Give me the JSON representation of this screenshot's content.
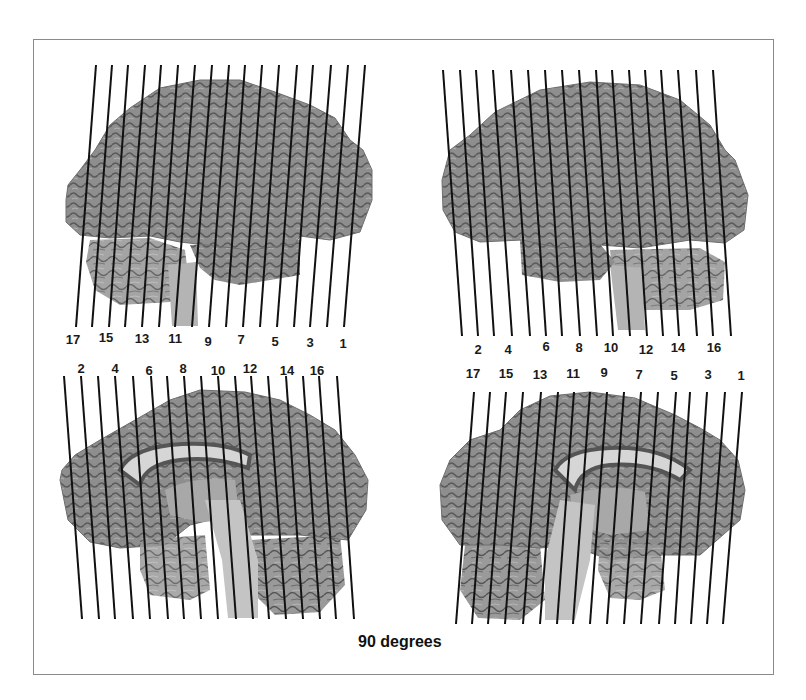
{
  "caption": "90 degrees",
  "colors": {
    "frame": "#8a8a8a",
    "line": "#111111",
    "brain_fill": "#8c8c8c",
    "brain_dark": "#4a4a4a",
    "brain_light": "#c8c8c8",
    "callosum": "#d9d9d9"
  },
  "panels": [
    {
      "id": "top-left",
      "view": "lateral-left",
      "line_top_y": 65,
      "line_bottom_y": 327,
      "lines_top_x": [
        96,
        112,
        128,
        145,
        161,
        178,
        195,
        212,
        229,
        245,
        262,
        279,
        297,
        313,
        331,
        348,
        365
      ],
      "lines_bottom_x": [
        76,
        92,
        109,
        125,
        142,
        159,
        175,
        192,
        209,
        226,
        243,
        260,
        277,
        294,
        310,
        327,
        344
      ],
      "labels": [
        {
          "text": "17",
          "x": 73,
          "y": 332
        },
        {
          "text": "15",
          "x": 106,
          "y": 330
        },
        {
          "text": "13",
          "x": 142,
          "y": 331
        },
        {
          "text": "11",
          "x": 175,
          "y": 331
        },
        {
          "text": "9",
          "x": 208,
          "y": 334
        },
        {
          "text": "7",
          "x": 241,
          "y": 332
        },
        {
          "text": "5",
          "x": 275,
          "y": 334
        },
        {
          "text": "3",
          "x": 310,
          "y": 335
        },
        {
          "text": "1",
          "x": 343,
          "y": 336
        }
      ]
    },
    {
      "id": "top-right",
      "view": "lateral-right",
      "line_top_y": 70,
      "line_bottom_y": 336,
      "lines_top_x": [
        443,
        460,
        476,
        493,
        511,
        528,
        545,
        562,
        579,
        596,
        612,
        629,
        645,
        661,
        678,
        696,
        713
      ],
      "lines_bottom_x": [
        462,
        478,
        494,
        512,
        530,
        546,
        562,
        580,
        597,
        613,
        630,
        647,
        663,
        679,
        697,
        713,
        731
      ],
      "labels": [
        {
          "text": "2",
          "x": 478,
          "y": 342
        },
        {
          "text": "4",
          "x": 508,
          "y": 342
        },
        {
          "text": "6",
          "x": 546,
          "y": 339
        },
        {
          "text": "8",
          "x": 579,
          "y": 340
        },
        {
          "text": "10",
          "x": 611,
          "y": 340
        },
        {
          "text": "12",
          "x": 646,
          "y": 342
        },
        {
          "text": "14",
          "x": 678,
          "y": 340
        },
        {
          "text": "16",
          "x": 714,
          "y": 340
        }
      ]
    },
    {
      "id": "bottom-left",
      "view": "medial-left",
      "line_top_y": 376,
      "line_bottom_y": 619,
      "lines_top_x": [
        64,
        81,
        98,
        115,
        133,
        151,
        167,
        184,
        201,
        218,
        235,
        251,
        268,
        286,
        303,
        319,
        337
      ],
      "lines_bottom_x": [
        82,
        99,
        115,
        133,
        150,
        168,
        184,
        201,
        218,
        236,
        253,
        269,
        286,
        303,
        320,
        336,
        354
      ],
      "labels": [
        {
          "text": "2",
          "x": 81,
          "y": 361
        },
        {
          "text": "4",
          "x": 115,
          "y": 361
        },
        {
          "text": "6",
          "x": 149,
          "y": 363
        },
        {
          "text": "8",
          "x": 183,
          "y": 361
        },
        {
          "text": "10",
          "x": 218,
          "y": 363
        },
        {
          "text": "12",
          "x": 250,
          "y": 361
        },
        {
          "text": "14",
          "x": 287,
          "y": 363
        },
        {
          "text": "16",
          "x": 317,
          "y": 363
        }
      ]
    },
    {
      "id": "bottom-right",
      "view": "medial-right",
      "line_top_y": 392,
      "line_bottom_y": 624,
      "lines_top_x": [
        474,
        490,
        506,
        523,
        541,
        558,
        574,
        590,
        607,
        624,
        641,
        658,
        676,
        690,
        707,
        725,
        742
      ],
      "lines_bottom_x": [
        456,
        472,
        488,
        505,
        523,
        540,
        557,
        573,
        590,
        607,
        624,
        641,
        659,
        675,
        691,
        707,
        723
      ],
      "labels": [
        {
          "text": "17",
          "x": 473,
          "y": 366
        },
        {
          "text": "15",
          "x": 506,
          "y": 366
        },
        {
          "text": "13",
          "x": 540,
          "y": 367
        },
        {
          "text": "11",
          "x": 573,
          "y": 366
        },
        {
          "text": "9",
          "x": 604,
          "y": 365
        },
        {
          "text": "7",
          "x": 639,
          "y": 367
        },
        {
          "text": "5",
          "x": 674,
          "y": 368
        },
        {
          "text": "3",
          "x": 708,
          "y": 367
        },
        {
          "text": "1",
          "x": 741,
          "y": 368
        }
      ]
    }
  ]
}
